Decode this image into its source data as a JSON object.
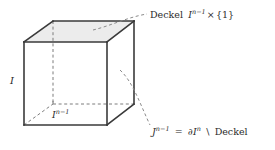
{
  "figure": {
    "name": "cube-diagram-deckel",
    "background_color": "#ffffff",
    "edge_color": "#3a3a3a",
    "hidden_edge_color": "#7d7d7d",
    "leader_color": "#8a8a8a",
    "top_face_fill": "#ececec",
    "side_face_fill": "#ffffff",
    "text_color": "#2b2b2b"
  },
  "labels": {
    "top_right": {
      "word": "Deckel",
      "base": "I",
      "exponent": "n−1",
      "operator": "×",
      "set": "{1}",
      "full_text": "Deckel I^{n−1} × {1}"
    },
    "bottom_right": {
      "base": "J",
      "exponent": "n−1",
      "equals": "=",
      "boundary_symbol": "∂",
      "boundary_base": "I",
      "boundary_exponent": "n",
      "setminus": "\\",
      "word": "Deckel",
      "full_text": "J^{n−1} = ∂I^n \\ Deckel"
    },
    "left_edge": {
      "base": "I",
      "full_text": "I"
    },
    "bottom_face": {
      "base": "I",
      "exponent": "n−1",
      "full_text": "I^{n−1}"
    }
  },
  "geometry": {
    "front_top_left": [
      24,
      42
    ],
    "front_top_right": [
      107,
      42
    ],
    "front_bottom_left": [
      24,
      125
    ],
    "front_bottom_right": [
      107,
      125
    ],
    "back_top_left": [
      53,
      21
    ],
    "back_top_right": [
      134,
      21
    ],
    "back_bottom_left": [
      53,
      104
    ],
    "back_bottom_right": [
      134,
      104
    ]
  }
}
